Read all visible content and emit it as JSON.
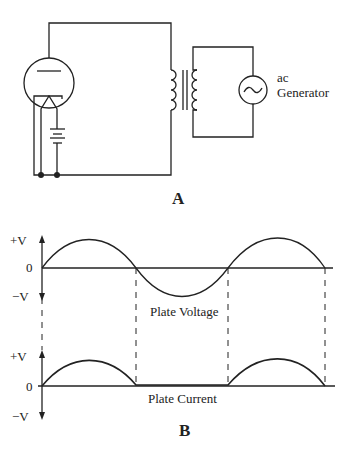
{
  "figure_a": {
    "label": "A",
    "generator_label_line1": "ac",
    "generator_label_line2": "Generator",
    "components": [
      "vacuum-tube-diode",
      "filament-battery",
      "transformer",
      "ac-generator"
    ]
  },
  "figure_b": {
    "label": "B",
    "voltage_graph": {
      "title": "Plate Voltage",
      "y_top": "+V",
      "y_zero": "0",
      "y_bottom": "−V"
    },
    "current_graph": {
      "title": "Plate Current",
      "y_top": "+V",
      "y_zero": "0",
      "y_bottom": "−V"
    }
  },
  "colors": {
    "ink": "#222222",
    "background": "#ffffff"
  }
}
